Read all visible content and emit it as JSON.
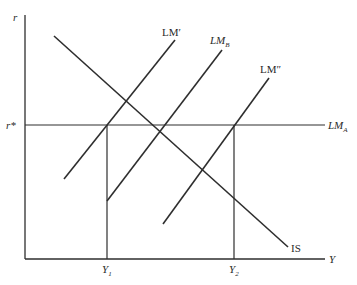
{
  "diagram": {
    "colors": {
      "line": "#2e2e2e",
      "text": "#2a2a2a",
      "background": "#ffffff"
    },
    "axes": {
      "y_label": "r",
      "x_label": "Y",
      "origin": [
        25,
        259
      ],
      "y_top": 15,
      "x_right": 325
    },
    "r_star": {
      "label": "r*",
      "y": 125
    },
    "curves": [
      {
        "id": "IS",
        "label": "IS",
        "x1": 54,
        "y1": 36,
        "x2": 288,
        "y2": 247,
        "label_x": 291,
        "label_y": 252,
        "italic": false
      },
      {
        "id": "LM_prime",
        "label": "LM′",
        "x1": 64,
        "y1": 179,
        "x2": 175,
        "y2": 40,
        "label_x": 162,
        "label_y": 36,
        "italic": false
      },
      {
        "id": "LM_B",
        "label": "LM",
        "sub": "B",
        "x1": 107,
        "y1": 201,
        "x2": 222,
        "y2": 50,
        "label_x": 210,
        "label_y": 44,
        "italic": true
      },
      {
        "id": "LM_double_prime",
        "label": "LM″",
        "x1": 163,
        "y1": 224,
        "x2": 269,
        "y2": 78,
        "label_x": 260,
        "label_y": 73,
        "italic": false
      },
      {
        "id": "LM_A",
        "label": "LM",
        "sub": "A",
        "x1": 25,
        "y1": 125,
        "x2": 325,
        "y2": 125,
        "label_x": 328,
        "label_y": 129,
        "italic": true
      }
    ],
    "guides": [
      {
        "id": "Y1",
        "label": "Y",
        "sub": "1",
        "x": 107,
        "y_top": 125,
        "y_bottom": 259
      },
      {
        "id": "Y2",
        "label": "Y",
        "sub": "2",
        "x": 234,
        "y_top": 125,
        "y_bottom": 259
      }
    ]
  }
}
